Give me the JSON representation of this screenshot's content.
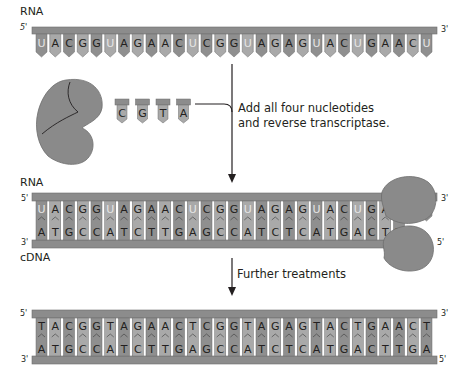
{
  "figure": {
    "rna_label_top": "RNA",
    "rna_label_middle": "RNA",
    "cdna_label": "cDNA",
    "ends": {
      "five_prime": "5'",
      "three_prime": "3'"
    },
    "step1_text_line1": "Add all four nucleotides",
    "step1_text_line2": "and reverse transcriptase.",
    "step2_text": "Further treatments",
    "free_nucleotides": [
      "C",
      "G",
      "T",
      "A"
    ],
    "rna_sequence": [
      "U",
      "A",
      "C",
      "G",
      "G",
      "U",
      "A",
      "G",
      "A",
      "A",
      "C",
      "U",
      "C",
      "G",
      "G",
      "U",
      "A",
      "G",
      "A",
      "G",
      "U",
      "A",
      "C",
      "U",
      "G",
      "A",
      "A",
      "C",
      "U"
    ],
    "cdna_sequence": [
      "A",
      "T",
      "G",
      "C",
      "C",
      "A",
      "T",
      "C",
      "T",
      "T",
      "G",
      "A",
      "G",
      "C",
      "C",
      "A",
      "T",
      "C",
      "T",
      "C",
      "A",
      "T",
      "G",
      "A",
      "C",
      "T",
      "T"
    ],
    "dna_top_sequence": [
      "T",
      "A",
      "C",
      "G",
      "G",
      "T",
      "A",
      "G",
      "A",
      "A",
      "C",
      "T",
      "C",
      "G",
      "G",
      "T",
      "A",
      "G",
      "A",
      "G",
      "T",
      "A",
      "C",
      "T",
      "G",
      "A",
      "A",
      "C",
      "T"
    ],
    "dna_bottom_sequence": [
      "A",
      "T",
      "G",
      "C",
      "C",
      "A",
      "T",
      "C",
      "T",
      "T",
      "G",
      "A",
      "G",
      "C",
      "C",
      "A",
      "T",
      "C",
      "T",
      "C",
      "A",
      "T",
      "G",
      "A",
      "C",
      "T",
      "T",
      "G",
      "A"
    ],
    "colors": {
      "backbone": "#8c8c8c",
      "backbone_edge": "#6d6d6d",
      "base_dark": "#8f8f8f",
      "base_light": "#a9a9a9",
      "enzyme": "#8a8a8a",
      "uracil_text": "#e6e6e6",
      "text": "#231f20"
    }
  }
}
